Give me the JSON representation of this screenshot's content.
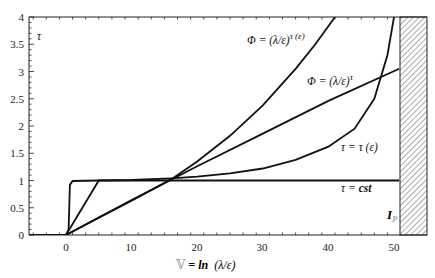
{
  "chart_data": {
    "type": "line",
    "title": "",
    "xlabel": "𝕍 = ln (λ/ε)",
    "ylabel": "τ",
    "xlim": [
      -5.5,
      55
    ],
    "ylim": [
      0,
      4
    ],
    "x_ticks": [
      0,
      10,
      20,
      30,
      40,
      50
    ],
    "y_ticks": [
      0,
      0.5,
      1,
      1.5,
      2,
      2.5,
      3,
      3.5,
      4
    ],
    "grid": false,
    "legend": "none (inline annotations)",
    "series": [
      {
        "name": "τ = cst",
        "x": [
          -5.5,
          0,
          0.4,
          0.6,
          1,
          5,
          10,
          20,
          30,
          40,
          50.8
        ],
        "y": [
          0,
          0,
          0.1,
          0.92,
          0.99,
          1,
          1,
          1,
          1,
          1,
          1
        ]
      },
      {
        "name": "τ = τ(ε)",
        "x": [
          -5.5,
          0,
          5,
          10,
          16,
          20,
          25,
          30,
          35,
          40,
          44,
          47,
          49,
          50
        ],
        "y": [
          0,
          0,
          1.0,
          1.01,
          1.04,
          1.07,
          1.13,
          1.22,
          1.38,
          1.62,
          1.95,
          2.5,
          3.3,
          4.0
        ]
      },
      {
        "name": "Φ = (λ/ε)^τ",
        "x": [
          0,
          10,
          20,
          30,
          40,
          50.8
        ],
        "y": [
          0,
          0.64,
          1.26,
          1.86,
          2.46,
          3.05
        ]
      },
      {
        "name": "Φ = (λ/ε)^τ(ε)",
        "x": [
          0,
          5,
          10,
          16,
          20,
          25,
          30,
          35,
          38,
          41
        ],
        "y": [
          0,
          0.32,
          0.63,
          1.02,
          1.35,
          1.82,
          2.38,
          3.05,
          3.5,
          4.0
        ]
      }
    ],
    "annotations": [
      {
        "text": "Φ = (λ/ε)^τ(ε)",
        "x": 28,
        "y": 3.6
      },
      {
        "text": "Φ = (λ/ε)^τ",
        "x": 36,
        "y": 2.8
      },
      {
        "text": "τ = τ(ε)",
        "x": 41,
        "y": 1.7
      },
      {
        "text": "τ = cst",
        "x": 43,
        "y": 0.85
      },
      {
        "text": "I_P",
        "x": 48.5,
        "y": 0.35
      }
    ],
    "shaded_region": {
      "x_from": 50.8,
      "x_to": 55,
      "pattern": "diagonal hatch",
      "label": "I_P"
    }
  },
  "labels": {
    "y_axis": "τ",
    "x_axis_prefix": "𝕍",
    "x_axis_eq": " = ",
    "x_axis_ln": "ln",
    "x_axis_arg": "  (λ/ε)",
    "ann_phi_tau_eps_base": "Φ = (λ/ε)",
    "ann_phi_tau_eps_exp": "τ (ε)",
    "ann_phi_tau_base": "Φ = (λ/ε)",
    "ann_phi_tau_exp": "τ",
    "ann_tau_eps": "τ =  τ (ε)",
    "ann_tau_cst_a": "τ = ",
    "ann_tau_cst_b": "cst",
    "ann_ip_main": "I",
    "ann_ip_sub": "P"
  },
  "ticks": {
    "x": [
      "0",
      "10",
      "20",
      "30",
      "40",
      "50"
    ],
    "y": [
      "0",
      "0.5",
      "1",
      "1.5",
      "2",
      "2.5",
      "3",
      "3.5",
      "4"
    ]
  }
}
